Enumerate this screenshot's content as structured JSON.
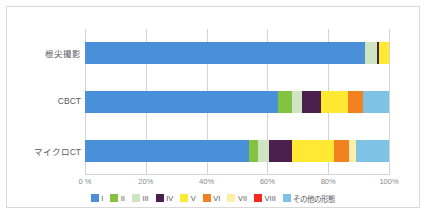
{
  "chart_data": {
    "type": "bar",
    "orientation": "horizontal",
    "stacked": true,
    "normalized": true,
    "title": "",
    "xlabel": "",
    "ylabel": "",
    "xlim": [
      0,
      100
    ],
    "grid": true,
    "legend_position": "bottom",
    "categories": [
      "根尖撮影",
      "CBCT",
      "マイクロCT"
    ],
    "xticks": [
      0,
      20,
      40,
      60,
      80,
      100
    ],
    "xticklabels": [
      "0 %",
      "20%",
      "40%",
      "60%",
      "80%",
      "100%"
    ],
    "series": [
      {
        "name": "I",
        "color": "#4a90d9",
        "values": [
          92.0,
          63.5,
          54.0
        ]
      },
      {
        "name": "II",
        "color": "#84c341",
        "values": [
          0.0,
          4.5,
          3.0
        ]
      },
      {
        "name": "III",
        "color": "#cfe4c0",
        "values": [
          4.0,
          3.5,
          3.5
        ]
      },
      {
        "name": "IV",
        "color": "#4b1f4e",
        "values": [
          0.8,
          6.0,
          7.5
        ]
      },
      {
        "name": "V",
        "color": "#ffe933",
        "values": [
          3.2,
          9.0,
          14.0
        ]
      },
      {
        "name": "VI",
        "color": "#f4811f",
        "values": [
          0.0,
          5.0,
          5.0
        ]
      },
      {
        "name": "VII",
        "color": "#fdeea8",
        "values": [
          0.0,
          0.0,
          2.0
        ]
      },
      {
        "name": "VIII",
        "color": "#f52a1e",
        "values": [
          0.0,
          0.0,
          0.0
        ]
      },
      {
        "name": "その他の形態",
        "color": "#7ec3e6",
        "values": [
          0.0,
          8.5,
          11.0
        ]
      }
    ]
  },
  "legend": {
    "items": [
      {
        "label": "I",
        "color": "#4a90d9"
      },
      {
        "label": "II",
        "color": "#84c341"
      },
      {
        "label": "III",
        "color": "#cfe4c0"
      },
      {
        "label": "IV",
        "color": "#4b1f4e"
      },
      {
        "label": "V",
        "color": "#ffe933"
      },
      {
        "label": "VI",
        "color": "#f4811f"
      },
      {
        "label": "VII",
        "color": "#fdeea8"
      },
      {
        "label": "VIII",
        "color": "#f52a1e"
      },
      {
        "label": "その他の形態",
        "color": "#7ec3e6"
      }
    ]
  },
  "colors": {
    "gridline": "#d4d4d4",
    "frame_border": "#d9d9d9",
    "axis_text": "#8a8a8c",
    "category_text": "#59595b",
    "background": "#ffffff"
  }
}
